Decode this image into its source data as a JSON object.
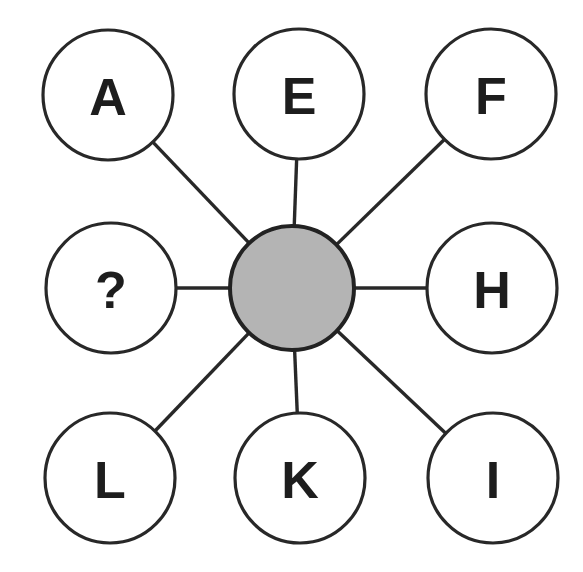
{
  "figure": {
    "type": "hub-and-spoke-diagram",
    "title": "",
    "background_color": "#ffffff",
    "canvas": {
      "width": 583,
      "height": 572
    }
  },
  "style": {
    "node_stroke_color": "#282828",
    "node_stroke_width": 3.2,
    "node_fill_color": "#ffffff",
    "hub_fill_color": "#b4b4b4",
    "hub_stroke_color": "#222222",
    "hub_stroke_width": 4,
    "line_color": "#282828",
    "line_width": 3.4,
    "label_color": "#1d1d1d",
    "label_font_size": 52
  },
  "hub": {
    "name": "center-node",
    "label": "",
    "cx": 292,
    "cy": 288,
    "r": 62
  },
  "nodes": [
    {
      "id": "a",
      "label": "A",
      "cx": 108,
      "cy": 95,
      "r": 65,
      "angle_deg": 135,
      "position": "top-left"
    },
    {
      "id": "e",
      "label": "E",
      "cx": 299,
      "cy": 94,
      "r": 65,
      "angle_deg": 90,
      "position": "top-center"
    },
    {
      "id": "f",
      "label": "F",
      "cx": 491,
      "cy": 94,
      "r": 65,
      "angle_deg": 45,
      "position": "top-right"
    },
    {
      "id": "q",
      "label": "?",
      "cx": 111,
      "cy": 288,
      "r": 65,
      "angle_deg": 180,
      "position": "middle-left"
    },
    {
      "id": "h",
      "label": "H",
      "cx": 492,
      "cy": 288,
      "r": 65,
      "angle_deg": 0,
      "position": "middle-right"
    },
    {
      "id": "l",
      "label": "L",
      "cx": 110,
      "cy": 478,
      "r": 65,
      "angle_deg": 225,
      "position": "bottom-left"
    },
    {
      "id": "k",
      "label": "K",
      "cx": 300,
      "cy": 478,
      "r": 65,
      "angle_deg": 270,
      "position": "bottom-center"
    },
    {
      "id": "i",
      "label": "I",
      "cx": 493,
      "cy": 478,
      "r": 65,
      "angle_deg": 315,
      "position": "bottom-right"
    }
  ],
  "edges": [
    {
      "from": "center-node",
      "to": "a"
    },
    {
      "from": "center-node",
      "to": "e"
    },
    {
      "from": "center-node",
      "to": "f"
    },
    {
      "from": "center-node",
      "to": "q"
    },
    {
      "from": "center-node",
      "to": "h"
    },
    {
      "from": "center-node",
      "to": "l"
    },
    {
      "from": "center-node",
      "to": "k"
    },
    {
      "from": "center-node",
      "to": "i"
    }
  ],
  "sequence": {
    "clockwise_from_top": [
      "E",
      "F",
      "H",
      "I",
      "K",
      "L",
      "?",
      "A"
    ],
    "missing_label": "?"
  }
}
